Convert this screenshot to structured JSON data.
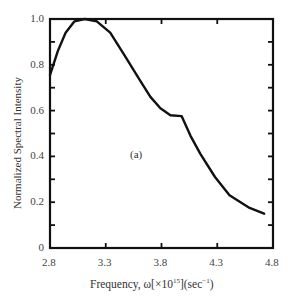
{
  "chart_data": {
    "type": "line",
    "title": "",
    "xlabel": "Frequency, ω[×10^15](sec^-1)",
    "ylabel": "Normalized Spectral Intensity",
    "xlim": [
      2.8,
      4.8
    ],
    "ylim": [
      0,
      1.0
    ],
    "x_ticks": [
      "2.8",
      "3.3",
      "3.8",
      "4.3",
      "4.8"
    ],
    "y_ticks": [
      "0",
      "0.2",
      "0.4",
      "0.6",
      "0.8",
      "1.0"
    ],
    "grid": false,
    "legend": null,
    "annotations": [
      "(a)"
    ],
    "series": [
      {
        "name": "spectral intensity",
        "x": [
          2.8,
          2.87,
          2.94,
          3.02,
          3.11,
          3.22,
          3.34,
          3.47,
          3.61,
          3.7,
          3.79,
          3.88,
          3.98,
          4.06,
          4.15,
          4.28,
          4.41,
          4.59,
          4.72
        ],
        "y": [
          0.755,
          0.86,
          0.94,
          0.99,
          1.0,
          0.99,
          0.94,
          0.84,
          0.73,
          0.66,
          0.61,
          0.58,
          0.576,
          0.49,
          0.41,
          0.31,
          0.23,
          0.175,
          0.15
        ]
      }
    ]
  },
  "labels": {
    "ylabel": "Normalized Spectral Intensity",
    "xlabel_prefix": "Frequency, ω[×10",
    "xlabel_exp": "15",
    "xlabel_mid": "](sec",
    "xlabel_exp2": "−1",
    "xlabel_suffix": ")",
    "annotation": "(a)",
    "x_ticks": [
      "2.8",
      "3.3",
      "3.8",
      "4.3",
      "4.8"
    ],
    "y_ticks": [
      "0",
      "0.2",
      "0.4",
      "0.6",
      "0.8",
      "1.0"
    ]
  }
}
